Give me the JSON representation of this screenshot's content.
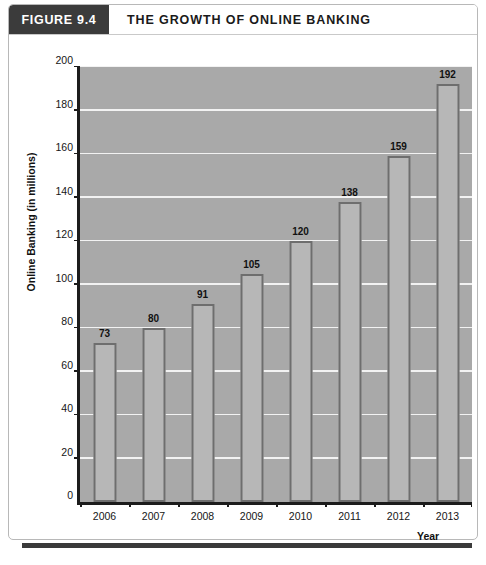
{
  "figure": {
    "number_label": "FIGURE 9.4",
    "title": "THE GROWTH OF ONLINE BANKING",
    "caption": ""
  },
  "colors": {
    "header_box": "#3b3b3b",
    "plot_background": "#a9a9a9",
    "gridline": "#f2f2f2",
    "bar_fill": "#b7b7b7",
    "bar_border": "#6e6e6e",
    "axis": "#1c1c1c",
    "footer_rule": "#3a3a3a"
  },
  "chart_data": {
    "type": "bar",
    "title": "THE GROWTH OF ONLINE BANKING",
    "xlabel": "Year",
    "ylabel": "Online Banking (in millions)",
    "categories": [
      "2006",
      "2007",
      "2008",
      "2009",
      "2010",
      "2011",
      "2012",
      "2013"
    ],
    "values": [
      73,
      80,
      91,
      105,
      120,
      138,
      159,
      192
    ],
    "data_labels": [
      "73",
      "80",
      "91",
      "105",
      "120",
      "138",
      "159",
      "192"
    ],
    "ylim": [
      0,
      200
    ],
    "ytick_step": 20,
    "ytick_labels": [
      "0",
      "20",
      "40",
      "60",
      "80",
      "100",
      "120",
      "140",
      "160",
      "180",
      "200"
    ],
    "grid": true,
    "grid_axis": "y",
    "legend": false,
    "legend_position": "none"
  }
}
